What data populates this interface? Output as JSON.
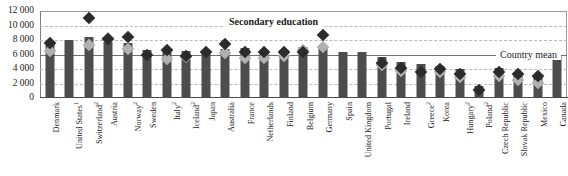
{
  "chart_data": {
    "type": "bar",
    "title": "",
    "xlabel": "",
    "ylabel": "",
    "ylim": [
      0,
      12000
    ],
    "grid": true,
    "ytick_labels": [
      "12 000",
      "10 000",
      "8 000",
      "6 000",
      "4 000",
      "2 000",
      "0"
    ],
    "ytick_values": [
      12000,
      10000,
      8000,
      6000,
      4000,
      2000,
      0
    ],
    "annotations": [
      {
        "text": "Secondary education",
        "value": 10500
      },
      {
        "text": "Country mean",
        "value": 6000
      }
    ],
    "country_mean": 6000,
    "categories": [
      "Denmark",
      "United States",
      "Switzerland",
      "Austria",
      "Norway",
      "Sweden",
      "Italy",
      "Iceland",
      "Japan",
      "Australia",
      "France",
      "Netherlands",
      "Finland",
      "Belgium",
      "Germany",
      "Spain",
      "United Kingdom",
      "Portugal",
      "Ireland",
      "Greece",
      "Korea",
      "Hungary",
      "Poland",
      "Czech Republic",
      "Slovak Republic",
      "Mexico",
      "Canada"
    ],
    "category_notes": [
      "",
      "1",
      "2",
      "",
      "2",
      "",
      "2",
      "2",
      "",
      "",
      "",
      "",
      "",
      "",
      "",
      "",
      "",
      "",
      "",
      "2",
      "",
      "2",
      "2",
      "",
      "",
      "",
      ""
    ],
    "series": [
      {
        "name": "Bar",
        "type": "bar",
        "values": [
          7400,
          8000,
          8450,
          7700,
          7600,
          6600,
          6500,
          6500,
          6650,
          6800,
          6900,
          6500,
          6600,
          7000,
          7100,
          6400,
          6300,
          5700,
          5000,
          4700,
          4400,
          4000,
          1700,
          4100,
          3600,
          2900,
          6000
        ]
      },
      {
        "name": "Secondary education",
        "type": "marker-dark",
        "values": [
          8200,
          null,
          11600,
          8700,
          9000,
          6500,
          7300,
          6400,
          7000,
          8100,
          7000,
          6900,
          6900,
          7000,
          9300,
          null,
          null,
          5400,
          4700,
          4200,
          4600,
          3900,
          1700,
          4200,
          3900,
          3600,
          null
        ]
      },
      {
        "name": "Lower series",
        "type": "marker-light",
        "values": [
          7100,
          null,
          8000,
          8900,
          7400,
          null,
          6000,
          6300,
          null,
          6800,
          6100,
          6200,
          6400,
          7300,
          7600,
          null,
          null,
          5200,
          4300,
          null,
          4200,
          3500,
          null,
          3700,
          3100,
          2700,
          null
        ]
      }
    ]
  }
}
